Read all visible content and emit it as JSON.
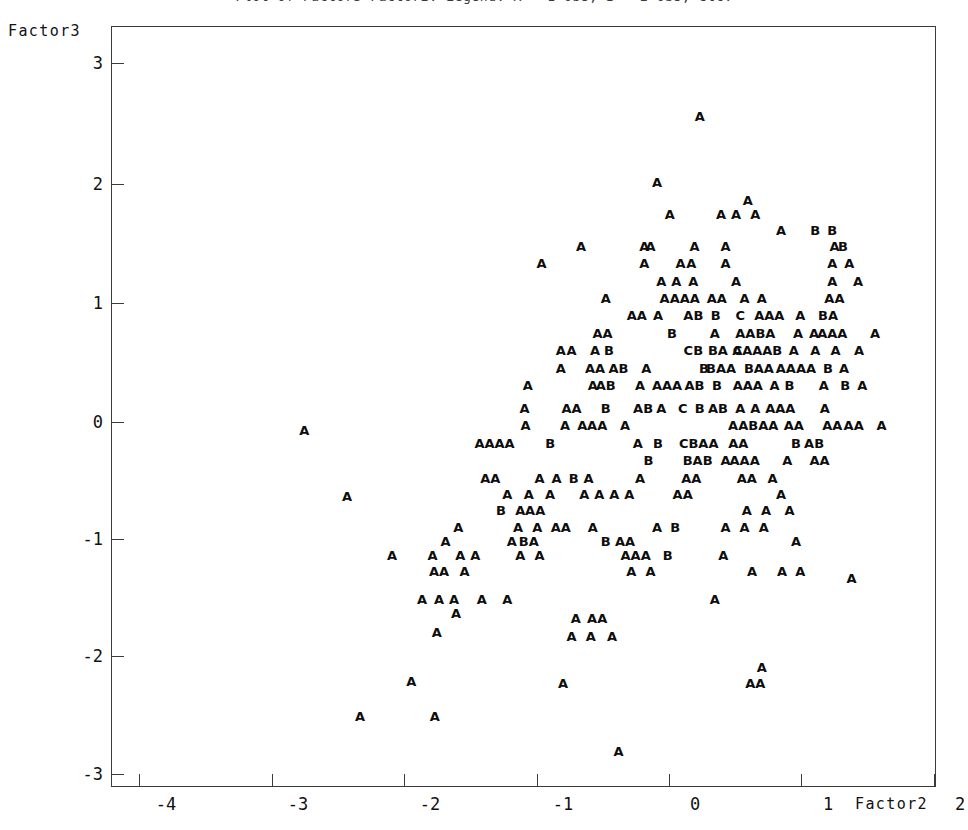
{
  "title": {
    "text": "Plot of Factor3*Factor2.  Legend: A = 1 obs, B = 2 obs, etc.",
    "clipped": true
  },
  "axes": {
    "ylabel": "Factor3",
    "xlabel": "Factor2",
    "y_ticks": [
      {
        "value": 3,
        "label": "3",
        "py": 62
      },
      {
        "value": 2,
        "label": "2",
        "py": 183
      },
      {
        "value": 1,
        "label": "1",
        "py": 302
      },
      {
        "value": 0,
        "label": "0",
        "py": 421
      },
      {
        "value": -1,
        "label": "-1",
        "py": 538
      },
      {
        "value": -2,
        "label": "-2",
        "py": 655
      },
      {
        "value": -3,
        "label": "-3",
        "py": 773
      }
    ],
    "x_ticks": [
      {
        "value": -4,
        "label": "-4",
        "px": 138,
        "label_px": 165
      },
      {
        "value": -3,
        "label": "-3",
        "px": 271,
        "label_px": 297
      },
      {
        "value": -2,
        "label": "-2",
        "px": 403,
        "label_px": 429
      },
      {
        "value": -1,
        "label": "-1",
        "px": 536,
        "label_px": 562
      },
      {
        "value": 0,
        "label": "0",
        "px": 668,
        "label_px": 694
      },
      {
        "value": 1,
        "label": "1",
        "px": 800,
        "label_px": 827
      },
      {
        "value": 2,
        "label": "2",
        "px": 933,
        "label_px": 959
      }
    ],
    "xlim": [
      -4.72,
      3.0
    ],
    "ylim": [
      -3.22,
      3.3
    ],
    "grid": false
  },
  "colors": {
    "frame": "#3b3b3b",
    "text": "#111111",
    "symbol": "#0d0d0d",
    "background": "#ffffff"
  },
  "chart_data": {
    "type": "scatter",
    "title": "Plot of Factor3*Factor2.  Legend: A = 1 obs, B = 2 obs, etc.",
    "xlabel": "Factor2",
    "ylabel": "Factor3",
    "xlim": [
      -4.72,
      3.0
    ],
    "ylim": [
      -3.22,
      3.3
    ],
    "grid": false,
    "legend": "A = 1 obs, B = 2 obs, C = 3 obs",
    "symbol_legend": {
      "A": 1,
      "B": 2,
      "C": 3
    },
    "points": [
      {
        "x": 0.78,
        "y": 2.54,
        "s": "A"
      },
      {
        "x": 0.38,
        "y": 1.97,
        "s": "A"
      },
      {
        "x": 1.23,
        "y": 1.82,
        "s": "A"
      },
      {
        "x": 0.5,
        "y": 1.7,
        "s": "A"
      },
      {
        "x": 0.98,
        "y": 1.7,
        "s": "A"
      },
      {
        "x": 1.12,
        "y": 1.7,
        "s": "A"
      },
      {
        "x": 1.3,
        "y": 1.7,
        "s": "A"
      },
      {
        "x": 1.54,
        "y": 1.56,
        "s": "A"
      },
      {
        "x": 1.86,
        "y": 1.56,
        "s": "B"
      },
      {
        "x": 2.02,
        "y": 1.56,
        "s": "B"
      },
      {
        "x": -0.33,
        "y": 1.42,
        "s": "A"
      },
      {
        "x": 0.26,
        "y": 1.42,
        "s": "A"
      },
      {
        "x": 0.32,
        "y": 1.42,
        "s": "A"
      },
      {
        "x": 0.73,
        "y": 1.42,
        "s": "A"
      },
      {
        "x": 1.02,
        "y": 1.42,
        "s": "A"
      },
      {
        "x": 2.04,
        "y": 1.42,
        "s": "A"
      },
      {
        "x": 2.12,
        "y": 1.42,
        "s": "B"
      },
      {
        "x": -0.7,
        "y": 1.28,
        "s": "A"
      },
      {
        "x": 0.26,
        "y": 1.28,
        "s": "A"
      },
      {
        "x": 0.6,
        "y": 1.28,
        "s": "A"
      },
      {
        "x": 0.7,
        "y": 1.28,
        "s": "A"
      },
      {
        "x": 1.02,
        "y": 1.28,
        "s": "A"
      },
      {
        "x": 2.02,
        "y": 1.28,
        "s": "A"
      },
      {
        "x": 2.18,
        "y": 1.28,
        "s": "A"
      },
      {
        "x": 0.42,
        "y": 1.12,
        "s": "A"
      },
      {
        "x": 0.56,
        "y": 1.12,
        "s": "A"
      },
      {
        "x": 0.72,
        "y": 1.12,
        "s": "A"
      },
      {
        "x": 1.12,
        "y": 1.12,
        "s": "A"
      },
      {
        "x": 2.02,
        "y": 1.12,
        "s": "A"
      },
      {
        "x": 2.26,
        "y": 1.12,
        "s": "A"
      },
      {
        "x": -0.1,
        "y": 0.98,
        "s": "A"
      },
      {
        "x": 0.45,
        "y": 0.98,
        "s": "A"
      },
      {
        "x": 0.64,
        "y": 0.98,
        "s": "AAA"
      },
      {
        "x": 0.94,
        "y": 0.98,
        "s": "AA"
      },
      {
        "x": 1.2,
        "y": 0.98,
        "s": "A"
      },
      {
        "x": 1.36,
        "y": 0.98,
        "s": "A"
      },
      {
        "x": 2.04,
        "y": 0.98,
        "s": "AA"
      },
      {
        "x": 0.19,
        "y": 0.83,
        "s": "AA"
      },
      {
        "x": 0.39,
        "y": 0.83,
        "s": "A"
      },
      {
        "x": 0.72,
        "y": 0.83,
        "s": "AB"
      },
      {
        "x": 0.93,
        "y": 0.83,
        "s": "B"
      },
      {
        "x": 1.16,
        "y": 0.83,
        "s": "C"
      },
      {
        "x": 1.43,
        "y": 0.83,
        "s": "AAA"
      },
      {
        "x": 1.72,
        "y": 0.83,
        "s": "A"
      },
      {
        "x": 1.98,
        "y": 0.83,
        "s": "BA"
      },
      {
        "x": -0.13,
        "y": 0.68,
        "s": "AA"
      },
      {
        "x": 0.52,
        "y": 0.68,
        "s": "B"
      },
      {
        "x": 0.92,
        "y": 0.68,
        "s": "A"
      },
      {
        "x": 1.3,
        "y": 0.68,
        "s": "AABA"
      },
      {
        "x": 1.7,
        "y": 0.68,
        "s": "A"
      },
      {
        "x": 1.85,
        "y": 0.68,
        "s": "A"
      },
      {
        "x": 2.02,
        "y": 0.68,
        "s": "AAA"
      },
      {
        "x": 2.42,
        "y": 0.68,
        "s": "A"
      },
      {
        "x": -0.52,
        "y": 0.53,
        "s": "A"
      },
      {
        "x": -0.42,
        "y": 0.53,
        "s": "A"
      },
      {
        "x": -0.2,
        "y": 0.53,
        "s": "A"
      },
      {
        "x": -0.07,
        "y": 0.53,
        "s": "B"
      },
      {
        "x": 0.72,
        "y": 0.53,
        "s": "CB"
      },
      {
        "x": 0.95,
        "y": 0.53,
        "s": "BA"
      },
      {
        "x": 1.13,
        "y": 0.53,
        "s": "A"
      },
      {
        "x": 1.32,
        "y": 0.53,
        "s": "CAAAB"
      },
      {
        "x": 1.66,
        "y": 0.53,
        "s": "A"
      },
      {
        "x": 1.86,
        "y": 0.53,
        "s": "A"
      },
      {
        "x": 2.05,
        "y": 0.53,
        "s": "A"
      },
      {
        "x": 2.27,
        "y": 0.53,
        "s": "A"
      },
      {
        "x": -0.52,
        "y": 0.38,
        "s": "A"
      },
      {
        "x": -0.2,
        "y": 0.38,
        "s": "AA"
      },
      {
        "x": 0.02,
        "y": 0.38,
        "s": "AB"
      },
      {
        "x": 0.28,
        "y": 0.38,
        "s": "A"
      },
      {
        "x": 0.82,
        "y": 0.38,
        "s": "B"
      },
      {
        "x": 0.98,
        "y": 0.38,
        "s": "BAA"
      },
      {
        "x": 1.24,
        "y": 0.38,
        "s": "B"
      },
      {
        "x": 1.38,
        "y": 0.38,
        "s": "AA"
      },
      {
        "x": 1.68,
        "y": 0.38,
        "s": "AAAA"
      },
      {
        "x": 1.98,
        "y": 0.38,
        "s": "B"
      },
      {
        "x": 2.13,
        "y": 0.38,
        "s": "A"
      },
      {
        "x": -0.83,
        "y": 0.23,
        "s": "A"
      },
      {
        "x": -0.22,
        "y": 0.23,
        "s": "A"
      },
      {
        "x": -0.1,
        "y": 0.23,
        "s": "AB"
      },
      {
        "x": 0.22,
        "y": 0.23,
        "s": "A"
      },
      {
        "x": 0.38,
        "y": 0.23,
        "s": "A"
      },
      {
        "x": 0.52,
        "y": 0.23,
        "s": "AA"
      },
      {
        "x": 0.73,
        "y": 0.23,
        "s": "AB"
      },
      {
        "x": 0.94,
        "y": 0.23,
        "s": "B"
      },
      {
        "x": 1.23,
        "y": 0.23,
        "s": "AAA"
      },
      {
        "x": 1.48,
        "y": 0.23,
        "s": "A"
      },
      {
        "x": 1.62,
        "y": 0.23,
        "s": "B"
      },
      {
        "x": 1.94,
        "y": 0.23,
        "s": "A"
      },
      {
        "x": 2.14,
        "y": 0.23,
        "s": "B"
      },
      {
        "x": 2.3,
        "y": 0.23,
        "s": "A"
      },
      {
        "x": -0.86,
        "y": 0.04,
        "s": "A"
      },
      {
        "x": -0.42,
        "y": 0.04,
        "s": "AA"
      },
      {
        "x": -0.1,
        "y": 0.04,
        "s": "B"
      },
      {
        "x": 0.25,
        "y": 0.04,
        "s": "AB"
      },
      {
        "x": 0.42,
        "y": 0.04,
        "s": "A"
      },
      {
        "x": 0.62,
        "y": 0.04,
        "s": "C"
      },
      {
        "x": 0.78,
        "y": 0.04,
        "s": "B"
      },
      {
        "x": 0.95,
        "y": 0.04,
        "s": "AB"
      },
      {
        "x": 1.16,
        "y": 0.04,
        "s": "A"
      },
      {
        "x": 1.3,
        "y": 0.04,
        "s": "A"
      },
      {
        "x": 1.44,
        "y": 0.04,
        "s": "A"
      },
      {
        "x": 1.58,
        "y": 0.04,
        "s": "AA"
      },
      {
        "x": 1.95,
        "y": 0.04,
        "s": "A"
      },
      {
        "x": -0.85,
        "y": -0.11,
        "s": "A"
      },
      {
        "x": -0.48,
        "y": -0.11,
        "s": "A"
      },
      {
        "x": -0.32,
        "y": -0.11,
        "s": "A"
      },
      {
        "x": -0.18,
        "y": -0.11,
        "s": "AA"
      },
      {
        "x": 0.08,
        "y": -0.11,
        "s": "A"
      },
      {
        "x": 1.28,
        "y": -0.11,
        "s": "AABAA"
      },
      {
        "x": 1.66,
        "y": -0.11,
        "s": "AA"
      },
      {
        "x": 2.02,
        "y": -0.11,
        "s": "AA"
      },
      {
        "x": 2.22,
        "y": -0.11,
        "s": "AA"
      },
      {
        "x": 2.48,
        "y": -0.11,
        "s": "A"
      },
      {
        "x": -1.14,
        "y": -0.26,
        "s": "AAAA"
      },
      {
        "x": -0.62,
        "y": -0.26,
        "s": "B"
      },
      {
        "x": 0.2,
        "y": -0.26,
        "s": "A"
      },
      {
        "x": 0.39,
        "y": -0.26,
        "s": "B"
      },
      {
        "x": 0.77,
        "y": -0.26,
        "s": "CBAA"
      },
      {
        "x": 1.14,
        "y": -0.26,
        "s": "AA"
      },
      {
        "x": 1.68,
        "y": -0.26,
        "s": "B"
      },
      {
        "x": 1.85,
        "y": -0.26,
        "s": "AB"
      },
      {
        "x": 0.3,
        "y": -0.41,
        "s": "B"
      },
      {
        "x": 0.76,
        "y": -0.41,
        "s": "BAB"
      },
      {
        "x": 1.02,
        "y": -0.41,
        "s": "A"
      },
      {
        "x": 1.2,
        "y": -0.41,
        "s": "AAA"
      },
      {
        "x": 1.6,
        "y": -0.41,
        "s": "A"
      },
      {
        "x": 1.9,
        "y": -0.41,
        "s": "AA"
      },
      {
        "x": -1.18,
        "y": -0.56,
        "s": "AA"
      },
      {
        "x": -0.72,
        "y": -0.56,
        "s": "A"
      },
      {
        "x": -0.56,
        "y": -0.56,
        "s": "A"
      },
      {
        "x": -0.4,
        "y": -0.56,
        "s": "B"
      },
      {
        "x": -0.26,
        "y": -0.56,
        "s": "A"
      },
      {
        "x": 0.22,
        "y": -0.56,
        "s": "A"
      },
      {
        "x": 0.7,
        "y": -0.56,
        "s": "AA"
      },
      {
        "x": 1.22,
        "y": -0.56,
        "s": "AA"
      },
      {
        "x": 1.46,
        "y": -0.56,
        "s": "A"
      },
      {
        "x": -1.02,
        "y": -0.7,
        "s": "A"
      },
      {
        "x": -0.82,
        "y": -0.7,
        "s": "A"
      },
      {
        "x": -0.62,
        "y": -0.7,
        "s": "A"
      },
      {
        "x": -0.3,
        "y": -0.7,
        "s": "A"
      },
      {
        "x": -0.16,
        "y": -0.7,
        "s": "A"
      },
      {
        "x": -0.02,
        "y": -0.7,
        "s": "A"
      },
      {
        "x": 0.12,
        "y": -0.7,
        "s": "A"
      },
      {
        "x": 0.62,
        "y": -0.7,
        "s": "AA"
      },
      {
        "x": 1.54,
        "y": -0.7,
        "s": "A"
      },
      {
        "x": -1.08,
        "y": -0.84,
        "s": "B"
      },
      {
        "x": -0.9,
        "y": -0.84,
        "s": "A"
      },
      {
        "x": -0.76,
        "y": -0.84,
        "s": "AA"
      },
      {
        "x": 1.22,
        "y": -0.84,
        "s": "A"
      },
      {
        "x": 1.4,
        "y": -0.84,
        "s": "A"
      },
      {
        "x": 1.62,
        "y": -0.84,
        "s": "A"
      },
      {
        "x": -1.48,
        "y": -0.98,
        "s": "A"
      },
      {
        "x": -0.92,
        "y": -0.98,
        "s": "A"
      },
      {
        "x": -0.74,
        "y": -0.98,
        "s": "A"
      },
      {
        "x": -0.52,
        "y": -0.98,
        "s": "AA"
      },
      {
        "x": -0.22,
        "y": -0.98,
        "s": "A"
      },
      {
        "x": 0.38,
        "y": -0.98,
        "s": "A"
      },
      {
        "x": 0.55,
        "y": -0.98,
        "s": "B"
      },
      {
        "x": 1.02,
        "y": -0.98,
        "s": "A"
      },
      {
        "x": 1.2,
        "y": -0.98,
        "s": "A"
      },
      {
        "x": 1.38,
        "y": -0.98,
        "s": "A"
      },
      {
        "x": -1.6,
        "y": -1.1,
        "s": "A"
      },
      {
        "x": -0.98,
        "y": -1.1,
        "s": "A"
      },
      {
        "x": -0.82,
        "y": -1.1,
        "s": "BA"
      },
      {
        "x": -0.1,
        "y": -1.1,
        "s": "B"
      },
      {
        "x": 0.08,
        "y": -1.1,
        "s": "AA"
      },
      {
        "x": 1.68,
        "y": -1.1,
        "s": "A"
      },
      {
        "x": -2.1,
        "y": -1.22,
        "s": "A"
      },
      {
        "x": -1.72,
        "y": -1.22,
        "s": "A"
      },
      {
        "x": -1.46,
        "y": -1.22,
        "s": "A"
      },
      {
        "x": -1.32,
        "y": -1.22,
        "s": "A"
      },
      {
        "x": -0.9,
        "y": -1.22,
        "s": "A"
      },
      {
        "x": -0.72,
        "y": -1.22,
        "s": "A"
      },
      {
        "x": 0.18,
        "y": -1.22,
        "s": "AAA"
      },
      {
        "x": 0.48,
        "y": -1.22,
        "s": "B"
      },
      {
        "x": 1.0,
        "y": -1.22,
        "s": "A"
      },
      {
        "x": -1.66,
        "y": -1.36,
        "s": "AA"
      },
      {
        "x": -1.42,
        "y": -1.36,
        "s": "A"
      },
      {
        "x": 0.14,
        "y": -1.36,
        "s": "A"
      },
      {
        "x": 0.32,
        "y": -1.36,
        "s": "A"
      },
      {
        "x": 1.27,
        "y": -1.36,
        "s": "A"
      },
      {
        "x": 1.55,
        "y": -1.36,
        "s": "A"
      },
      {
        "x": 1.72,
        "y": -1.36,
        "s": "A"
      },
      {
        "x": 2.2,
        "y": -1.42,
        "s": "A"
      },
      {
        "x": -1.82,
        "y": -1.6,
        "s": "A"
      },
      {
        "x": -1.66,
        "y": -1.6,
        "s": "A"
      },
      {
        "x": -1.52,
        "y": -1.6,
        "s": "A"
      },
      {
        "x": -1.26,
        "y": -1.6,
        "s": "A"
      },
      {
        "x": -1.02,
        "y": -1.6,
        "s": "A"
      },
      {
        "x": 0.92,
        "y": -1.6,
        "s": "A"
      },
      {
        "x": -1.5,
        "y": -1.72,
        "s": "A"
      },
      {
        "x": -0.38,
        "y": -1.76,
        "s": "A"
      },
      {
        "x": -0.18,
        "y": -1.76,
        "s": "AA"
      },
      {
        "x": -1.68,
        "y": -1.88,
        "s": "A"
      },
      {
        "x": -0.42,
        "y": -1.92,
        "s": "A"
      },
      {
        "x": -0.24,
        "y": -1.92,
        "s": "A"
      },
      {
        "x": -0.04,
        "y": -1.92,
        "s": "A"
      },
      {
        "x": 1.36,
        "y": -2.18,
        "s": "A"
      },
      {
        "x": -1.92,
        "y": -2.3,
        "s": "A"
      },
      {
        "x": -0.5,
        "y": -2.32,
        "s": "A"
      },
      {
        "x": 1.3,
        "y": -2.32,
        "s": "AA"
      },
      {
        "x": -2.4,
        "y": -2.6,
        "s": "A"
      },
      {
        "x": -1.7,
        "y": -2.6,
        "s": "A"
      },
      {
        "x": 0.02,
        "y": -2.9,
        "s": "A"
      },
      {
        "x": -2.92,
        "y": -0.15,
        "s": "A"
      },
      {
        "x": -2.52,
        "y": -0.72,
        "s": "A"
      }
    ]
  }
}
